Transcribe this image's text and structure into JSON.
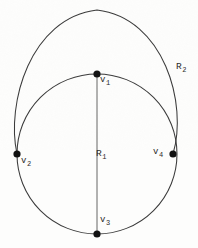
{
  "figure": {
    "kind": "geometric-diagram",
    "background_color": "#fdfdfc",
    "stroke_color": "#3a3a3a",
    "vertex_color": "#111111",
    "vertices": [
      {
        "id": "v1",
        "label": "v",
        "sub": "1",
        "x": 97,
        "y": 74,
        "label_x": 100,
        "label_y": 76
      },
      {
        "id": "v2",
        "label": "v",
        "sub": "2",
        "x": 17,
        "y": 154,
        "label_x": 21,
        "label_y": 157
      },
      {
        "id": "v3",
        "label": "v",
        "sub": "3",
        "x": 97,
        "y": 234,
        "label_x": 100,
        "label_y": 216
      },
      {
        "id": "v4",
        "label": "v",
        "sub": "4",
        "x": 173,
        "y": 154,
        "label_x": 153,
        "label_y": 148
      }
    ],
    "regions": [
      {
        "id": "R1",
        "label": "R",
        "sub": "1",
        "label_x": 96,
        "label_y": 149
      },
      {
        "id": "R2",
        "label": "R",
        "sub": "2",
        "label_x": 176,
        "label_y": 62
      }
    ],
    "inner_circle": {
      "cx": 97,
      "cy": 154,
      "r": 80
    },
    "outer_arc": {
      "cx": 97,
      "cy": 117,
      "r": 108
    },
    "chord": {
      "x1": 97,
      "y1": 74,
      "x2": 97,
      "y2": 234
    }
  }
}
